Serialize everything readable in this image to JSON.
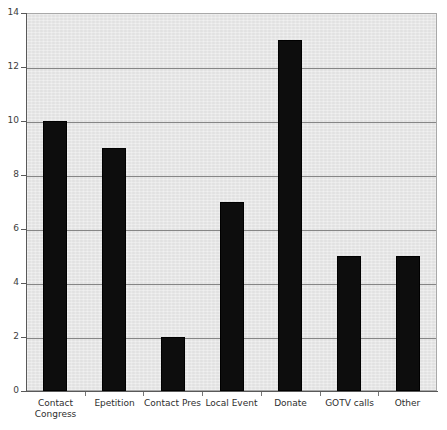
{
  "chart_data": {
    "type": "bar",
    "title": "",
    "xlabel": "",
    "ylabel": "",
    "categories": [
      "Contact Congress",
      "Epetition",
      "Contact Pres",
      "Local Event",
      "Donate",
      "GOTV calls",
      "Other"
    ],
    "values": [
      10,
      9,
      2,
      7,
      13,
      5,
      5
    ],
    "ylim": [
      0,
      14
    ],
    "y_ticks": [
      0,
      2,
      4,
      6,
      8,
      10,
      12,
      14
    ],
    "y_tick_labels": [
      "0",
      "2",
      "4",
      "6",
      "8",
      "10",
      "12",
      "14"
    ],
    "grid": true,
    "legend": false,
    "legend_position": "none",
    "bar_color": "#0d0d0d",
    "plot_background": "#e9e9e9",
    "gridline_color": "#868686",
    "axis_color": "#595959"
  },
  "labels": {
    "cat_0_line1": "Contact",
    "cat_0_line2": "Congress",
    "cat_1": "Epetition",
    "cat_2": "Contact Pres",
    "cat_3": "Local Event",
    "cat_4": "Donate",
    "cat_5": "GOTV calls",
    "cat_6": "Other"
  }
}
